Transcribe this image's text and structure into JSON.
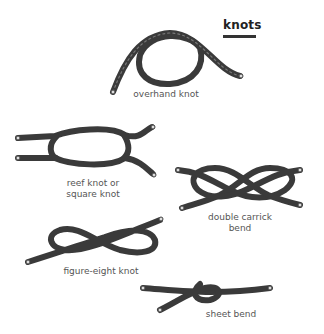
{
  "title": "knots",
  "knots": [
    {
      "name": "overhand-knot",
      "label_lines": [
        "overhand knot"
      ]
    },
    {
      "name": "reef-knot",
      "label_lines": [
        "reef knot or",
        "square knot"
      ]
    },
    {
      "name": "double-carrick-bend",
      "label_lines": [
        "double carrick",
        "bend"
      ]
    },
    {
      "name": "figure-eight-knot",
      "label_lines": [
        "figure-eight knot"
      ]
    },
    {
      "name": "sheet-bend",
      "label_lines": [
        "sheet bend"
      ]
    }
  ],
  "colors": {
    "rope": "#3a3a3a",
    "label": "#555555",
    "title": "#222222"
  }
}
